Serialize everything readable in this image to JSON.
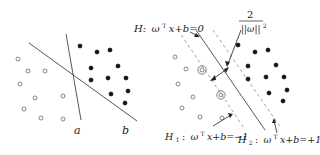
{
  "left_panel": {
    "line_a_label": "a",
    "line_b_label": "b",
    "open_points": [
      [
        18,
        59
      ],
      [
        28,
        71
      ],
      [
        45,
        71
      ],
      [
        20,
        84
      ],
      [
        35,
        98
      ],
      [
        63,
        96
      ],
      [
        24,
        109
      ],
      [
        41,
        118
      ],
      [
        63,
        119
      ]
    ],
    "filled_points": [
      [
        80,
        46
      ],
      [
        97,
        52
      ],
      [
        110,
        50
      ],
      [
        91,
        68
      ],
      [
        118,
        66
      ],
      [
        91,
        80
      ],
      [
        108,
        78
      ],
      [
        126,
        78
      ],
      [
        111,
        94
      ],
      [
        128,
        91
      ],
      [
        125,
        103
      ]
    ]
  },
  "right_panel": {
    "h_label_prefix": "H:",
    "h_label_eq": "ω",
    "h_label_sup": "T",
    "h_label_rest": "x+b=0",
    "margin_numerator": "2",
    "margin_denominator": "||ω||",
    "margin_power": "2",
    "h1_label_prefix": "H",
    "h1_label_sub": "1",
    "h1_label_colon": ":",
    "h1_label_eq": "ω",
    "h1_label_sup": "T",
    "h1_label_rest": "x+b=−1",
    "h2_label_prefix": "H",
    "h2_label_sub": "2",
    "h2_label_colon": ":",
    "h2_label_eq": "ω",
    "h2_label_sup": "T",
    "h2_label_rest": "x+b=+1",
    "open_points": [
      [
        175,
        57
      ],
      [
        186,
        69
      ],
      [
        178,
        84
      ],
      [
        193,
        97
      ],
      [
        182,
        108
      ],
      [
        200,
        117
      ],
      [
        222,
        118
      ]
    ],
    "support_vectors": [
      [
        202,
        70
      ],
      [
        221,
        95
      ]
    ],
    "filled_points": [
      [
        238,
        45
      ],
      [
        255,
        52
      ],
      [
        268,
        50
      ],
      [
        248,
        66
      ],
      [
        276,
        65
      ],
      [
        248,
        79
      ],
      [
        266,
        77
      ],
      [
        284,
        77
      ],
      [
        269,
        93
      ],
      [
        287,
        90
      ],
      [
        283,
        101
      ]
    ]
  },
  "colors": {
    "line": "#444444",
    "point": "#111111",
    "dashed": "#888888"
  }
}
